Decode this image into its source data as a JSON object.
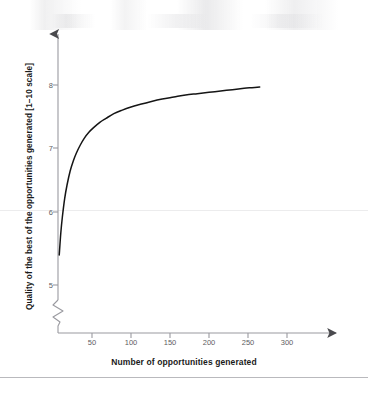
{
  "figure": {
    "background_color": "#ffffff",
    "line_color": "#151515",
    "axis_color": "#9a9aa0",
    "tick_text_color": "#5d5d62",
    "title_text_color": "#1a1a1a"
  },
  "chart_data": {
    "type": "line",
    "title": "",
    "subtitle": "",
    "xlabel": "Number of opportunities generated",
    "ylabel": "Quality of the best of the opportunities generated [1–10 scale]",
    "xlim": [
      0,
      345
    ],
    "ylim": [
      4.6,
      8.35
    ],
    "grid": false,
    "legend": null,
    "y_axis_break": true,
    "y_axis_break_label": "axis-break-zigzag",
    "xticks": [
      50,
      100,
      150,
      200,
      250,
      300
    ],
    "xtick_labels": [
      "50",
      "100",
      "150",
      "200",
      "250",
      "300"
    ],
    "yticks": [
      5,
      6,
      7,
      8
    ],
    "ytick_labels": [
      "5",
      "6",
      "7",
      "8"
    ],
    "annotations": [],
    "series": [
      {
        "name": "Quality of best opportunity",
        "x": [
          8,
          10,
          12,
          15,
          18,
          22,
          26,
          30,
          35,
          40,
          46,
          52,
          60,
          68,
          78,
          88,
          100,
          112,
          125,
          140,
          155,
          170,
          185,
          200,
          215,
          230,
          245,
          255,
          265
        ],
        "y": [
          5.45,
          5.78,
          6.02,
          6.3,
          6.5,
          6.71,
          6.86,
          6.98,
          7.1,
          7.2,
          7.29,
          7.36,
          7.44,
          7.5,
          7.57,
          7.62,
          7.67,
          7.71,
          7.75,
          7.79,
          7.82,
          7.85,
          7.87,
          7.89,
          7.91,
          7.93,
          7.95,
          7.96,
          7.97
        ]
      }
    ]
  }
}
